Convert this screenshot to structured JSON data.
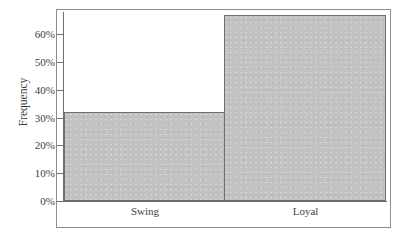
{
  "chart_data": {
    "type": "bar",
    "title": "",
    "subtitle": "",
    "xlabel": "",
    "ylabel": "Frequency",
    "categories": [
      "Swing",
      "Loyal"
    ],
    "values": [
      32,
      67
    ],
    "value_labels": [
      "32%",
      "67%"
    ],
    "ytick_labels": [
      "0%",
      "10%",
      "20%",
      "30%",
      "40%",
      "50%",
      "60%"
    ],
    "ytick_values": [
      0,
      10,
      20,
      30,
      40,
      50,
      60
    ],
    "ylim": [
      0,
      68
    ],
    "xlim_note": "categorical, bars adjacent with no gap",
    "grid": false,
    "legend": false,
    "legend_position": "none",
    "bar_fill_color": "#c2c2c2",
    "bar_border_color": "#6f6f6f",
    "axis_color": "#6f6f6f",
    "frame_color": "#8d8d8d",
    "background_color": "#ffffff",
    "annotations": []
  },
  "figure": {
    "outer_frame": true
  }
}
